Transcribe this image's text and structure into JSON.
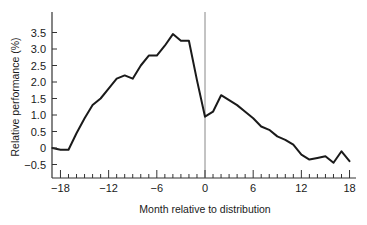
{
  "chart_data": {
    "type": "line",
    "title": "",
    "xlabel": "Month relative to distribution",
    "ylabel": "Relative performance (%)",
    "xlim": [
      -19,
      18
    ],
    "ylim": [
      -0.75,
      3.9
    ],
    "grid": false,
    "legend": null,
    "x_ticks": [
      -18,
      -12,
      -6,
      0,
      6,
      12,
      18
    ],
    "x_tick_labels": [
      "−18",
      "−12",
      "−6",
      "0",
      "6",
      "12",
      "18"
    ],
    "y_ticks": [
      -0.5,
      0,
      0.5,
      1.0,
      1.5,
      2.0,
      2.5,
      3.0,
      3.5
    ],
    "y_tick_labels": [
      "−0.5",
      "0",
      "0.5",
      "1.0",
      "1.5",
      "2.0",
      "2.5",
      "3.0",
      "3.5"
    ],
    "reference_line": {
      "x": 0,
      "orientation": "vertical"
    },
    "x": [
      -19,
      -18,
      -17,
      -16,
      -15,
      -14,
      -13,
      -12,
      -11,
      -10,
      -9,
      -8,
      -7,
      -6,
      -5,
      -4,
      -3,
      -2,
      -1,
      0,
      1,
      2,
      3,
      4,
      5,
      6,
      7,
      8,
      9,
      10,
      11,
      12,
      13,
      14,
      15,
      16,
      17,
      18
    ],
    "series": [
      {
        "name": "Relative performance",
        "values": [
          0.0,
          -0.05,
          -0.05,
          0.45,
          0.9,
          1.3,
          1.5,
          1.8,
          2.1,
          2.2,
          2.1,
          2.5,
          2.8,
          2.8,
          3.1,
          3.45,
          3.25,
          3.25,
          2.05,
          0.95,
          1.1,
          1.6,
          1.45,
          1.3,
          1.1,
          0.9,
          0.65,
          0.55,
          0.35,
          0.25,
          0.1,
          -0.2,
          -0.35,
          -0.3,
          -0.25,
          -0.45,
          -0.1,
          -0.4
        ]
      }
    ],
    "colors": {
      "line": "#1a1a1a",
      "axis": "#333333",
      "reference": "#888888"
    }
  }
}
